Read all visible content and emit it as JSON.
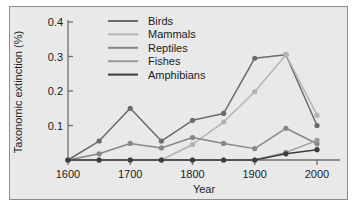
{
  "chart_data": {
    "type": "line",
    "title": "",
    "xlabel": "Year",
    "ylabel": "Taxonomic extinction (%)",
    "x": [
      1600,
      1650,
      1700,
      1750,
      1800,
      1850,
      1900,
      1950,
      2000
    ],
    "xlim": [
      1600,
      2000
    ],
    "ylim": [
      0,
      0.4
    ],
    "xticks": [
      1600,
      1700,
      1800,
      1900,
      2000
    ],
    "xtick_labels": [
      "1600",
      "1700",
      "1800",
      "1900",
      "2000"
    ],
    "yticks": [
      0.1,
      0.2,
      0.3,
      0.4
    ],
    "ytick_labels": [
      "0.1",
      "0.2",
      "0.3",
      "0.4"
    ],
    "grid": false,
    "legend_position": "upper-left-inside",
    "series": [
      {
        "name": "Birds",
        "color": "#6b6b6b",
        "values": [
          0.0,
          0.055,
          0.15,
          0.055,
          0.115,
          0.135,
          0.295,
          0.305,
          0.1
        ]
      },
      {
        "name": "Mammals",
        "color": "#b4b4b4",
        "values": [
          0.0,
          0.0,
          0.0,
          0.0,
          0.045,
          0.11,
          0.198,
          0.305,
          0.13
        ]
      },
      {
        "name": "Reptiles",
        "color": "#878787",
        "values": [
          0.0,
          0.018,
          0.048,
          0.035,
          0.065,
          0.048,
          0.033,
          0.092,
          0.047
        ]
      },
      {
        "name": "Fishes",
        "color": "#9a9a9a",
        "values": [
          0.0,
          0.0,
          0.0,
          0.0,
          0.0,
          0.0,
          0.0,
          0.022,
          0.057
        ]
      },
      {
        "name": "Amphibians",
        "color": "#3d3d3d",
        "values": [
          0.0,
          0.0,
          0.0,
          0.0,
          0.0,
          0.0,
          0.0,
          0.018,
          0.03
        ]
      }
    ]
  },
  "legend": {
    "entries": [
      {
        "label": "Birds"
      },
      {
        "label": "Mammals"
      },
      {
        "label": "Reptiles"
      },
      {
        "label": "Fishes"
      },
      {
        "label": "Amphibians"
      }
    ]
  },
  "axes": {
    "x_title": "Year",
    "y_title": "Taxonomic extinction (%)",
    "x_labels": [
      "1600",
      "1700",
      "1800",
      "1900",
      "2000"
    ],
    "y_labels": [
      "0.1",
      "0.2",
      "0.3",
      "0.4"
    ]
  },
  "style": {
    "plot_background": "#e9e9e9",
    "frame_color": "#8d8d8d",
    "axis_color": "#6f6f6f",
    "text_color": "#1c1c1c"
  }
}
